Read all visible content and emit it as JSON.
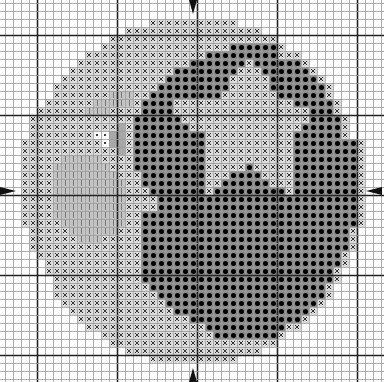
{
  "chart": {
    "type": "cross-stitch-pattern",
    "grid": {
      "columns": 47,
      "rows": 47,
      "cell_px": 8,
      "origin_x": 5,
      "origin_y": 3,
      "major_every": 10,
      "major_offset": 4
    },
    "colors": {
      "grid_minor": "#9a9a9a",
      "grid_major": "#222222",
      "cross_bg": "#d9d9d9",
      "dot_bg": "#8c8c8c",
      "vline_bg": "#c4c4c4",
      "pear_bg": "#a8a8a8",
      "white_bg": "#ffffff"
    },
    "legend_symbols": {
      "x": "light cross stitch",
      "o": "dark filled dot",
      "v": "vertical line stitch",
      "w": "white with small dot",
      "g": "medium gray"
    },
    "center_markers": [
      "top",
      "bottom",
      "left",
      "right"
    ],
    "rows": [
      [],
      [],
      [
        [
          "x",
          18,
          28
        ]
      ],
      [
        [
          "x",
          15,
          31
        ]
      ],
      [
        [
          "x",
          13,
          33
        ]
      ],
      [
        [
          "x",
          12,
          27
        ],
        [
          "o",
          28,
          33
        ],
        [
          "x",
          34,
          34
        ]
      ],
      [
        [
          "x",
          10,
          24
        ],
        [
          "o",
          25,
          33
        ],
        [
          "x",
          34,
          36
        ]
      ],
      [
        [
          "x",
          9,
          22
        ],
        [
          "o",
          23,
          29
        ],
        [
          "x",
          30,
          30
        ],
        [
          "o",
          31,
          36
        ],
        [
          "x",
          37,
          37
        ]
      ],
      [
        [
          "x",
          8,
          20
        ],
        [
          "o",
          21,
          28
        ],
        [
          "x",
          29,
          31
        ],
        [
          "o",
          32,
          37
        ],
        [
          "x",
          38,
          38
        ]
      ],
      [
        [
          "x",
          7,
          19
        ],
        [
          "o",
          20,
          27
        ],
        [
          "x",
          28,
          32
        ],
        [
          "o",
          33,
          38
        ],
        [
          "x",
          39,
          39
        ]
      ],
      [
        [
          "x",
          6,
          18
        ],
        [
          "o",
          19,
          27
        ],
        [
          "x",
          28,
          32
        ],
        [
          "o",
          33,
          39
        ],
        [
          "x",
          40,
          40
        ]
      ],
      [
        [
          "x",
          6,
          12
        ],
        [
          "v",
          13,
          15
        ],
        [
          "x",
          16,
          17
        ],
        [
          "o",
          18,
          26
        ],
        [
          "x",
          27,
          33
        ],
        [
          "o",
          34,
          39
        ],
        [
          "x",
          40,
          40
        ]
      ],
      [
        [
          "x",
          5,
          10
        ],
        [
          "v",
          11,
          15
        ],
        [
          "x",
          16,
          16
        ],
        [
          "o",
          17,
          20
        ],
        [
          "x",
          21,
          35
        ],
        [
          "o",
          36,
          40
        ],
        [
          "x",
          41,
          41
        ]
      ],
      [
        [
          "x",
          4,
          9
        ],
        [
          "v",
          10,
          12
        ],
        [
          "x",
          13,
          16
        ],
        [
          "o",
          17,
          20
        ],
        [
          "x",
          21,
          37
        ],
        [
          "o",
          38,
          40
        ],
        [
          "x",
          41,
          41
        ]
      ],
      [
        [
          "x",
          3,
          15
        ],
        [
          "o",
          16,
          21
        ],
        [
          "x",
          22,
          37
        ],
        [
          "o",
          38,
          41
        ],
        [
          "x",
          42,
          42
        ]
      ],
      [
        [
          "x",
          3,
          13
        ],
        [
          "g",
          14,
          14
        ],
        [
          "x",
          15,
          15
        ],
        [
          "o",
          16,
          22
        ],
        [
          "x",
          23,
          36
        ],
        [
          "o",
          37,
          41
        ],
        [
          "x",
          42,
          42
        ]
      ],
      [
        [
          "x",
          3,
          10
        ],
        [
          "w",
          11,
          12
        ],
        [
          "g",
          13,
          14
        ],
        [
          "x",
          15,
          15
        ],
        [
          "o",
          16,
          24
        ],
        [
          "x",
          25,
          35
        ],
        [
          "o",
          36,
          41
        ],
        [
          "x",
          42,
          42
        ]
      ],
      [
        [
          "x",
          2,
          11
        ],
        [
          "w",
          12,
          12
        ],
        [
          "g",
          13,
          14
        ],
        [
          "x",
          15,
          15
        ],
        [
          "o",
          16,
          24
        ],
        [
          "x",
          25,
          35
        ],
        [
          "o",
          36,
          43
        ],
        [
          "x",
          44,
          44
        ]
      ],
      [
        [
          "x",
          2,
          13
        ],
        [
          "g",
          14,
          14
        ],
        [
          "x",
          15,
          15
        ],
        [
          "o",
          16,
          24
        ],
        [
          "x",
          25,
          35
        ],
        [
          "o",
          36,
          43
        ],
        [
          "x",
          44,
          44
        ]
      ],
      [
        [
          "x",
          2,
          6
        ],
        [
          "v",
          7,
          11
        ],
        [
          "x",
          12,
          15
        ],
        [
          "o",
          16,
          24
        ],
        [
          "x",
          25,
          35
        ],
        [
          "o",
          36,
          43
        ],
        [
          "x",
          44,
          44
        ]
      ],
      [
        [
          "x",
          2,
          5
        ],
        [
          "v",
          6,
          12
        ],
        [
          "x",
          13,
          15
        ],
        [
          "o",
          16,
          24
        ],
        [
          "x",
          25,
          29
        ],
        [
          "o",
          30,
          30
        ],
        [
          "x",
          31,
          35
        ],
        [
          "o",
          36,
          43
        ],
        [
          "x",
          44,
          44
        ]
      ],
      [
        [
          "x",
          2,
          5
        ],
        [
          "v",
          6,
          13
        ],
        [
          "x",
          14,
          16
        ],
        [
          "o",
          17,
          24
        ],
        [
          "x",
          25,
          27
        ],
        [
          "o",
          28,
          31
        ],
        [
          "x",
          32,
          35
        ],
        [
          "o",
          36,
          43
        ],
        [
          "x",
          44,
          44
        ]
      ],
      [
        [
          "x",
          2,
          5
        ],
        [
          "v",
          6,
          14
        ],
        [
          "x",
          15,
          16
        ],
        [
          "o",
          17,
          24
        ],
        [
          "x",
          25,
          26
        ],
        [
          "o",
          27,
          32
        ],
        [
          "x",
          33,
          35
        ],
        [
          "o",
          36,
          43
        ],
        [
          "x",
          44,
          44
        ]
      ],
      [
        [
          "x",
          2,
          5
        ],
        [
          "v",
          6,
          14
        ],
        [
          "x",
          15,
          17
        ],
        [
          "o",
          18,
          24
        ],
        [
          "x",
          25,
          25
        ],
        [
          "o",
          26,
          34
        ],
        [
          "x",
          35,
          35
        ],
        [
          "o",
          36,
          43
        ],
        [
          "x",
          44,
          44
        ]
      ],
      [
        [
          "x",
          2,
          5
        ],
        [
          "v",
          6,
          14
        ],
        [
          "x",
          15,
          18
        ],
        [
          "o",
          19,
          43
        ],
        [
          "x",
          44,
          44
        ]
      ],
      [
        [
          "x",
          2,
          5
        ],
        [
          "v",
          6,
          14
        ],
        [
          "x",
          15,
          18
        ],
        [
          "o",
          19,
          43
        ],
        [
          "x",
          44,
          44
        ]
      ],
      [
        [
          "x",
          2,
          5
        ],
        [
          "v",
          6,
          14
        ],
        [
          "x",
          15,
          16
        ],
        [
          "o",
          17,
          43
        ],
        [
          "x",
          44,
          44
        ]
      ],
      [
        [
          "x",
          2,
          6
        ],
        [
          "v",
          7,
          14
        ],
        [
          "x",
          15,
          16
        ],
        [
          "o",
          17,
          43
        ],
        [
          "x",
          44,
          44
        ]
      ],
      [
        [
          "x",
          3,
          7
        ],
        [
          "v",
          8,
          13
        ],
        [
          "x",
          14,
          16
        ],
        [
          "o",
          17,
          42
        ],
        [
          "x",
          43,
          43
        ]
      ],
      [
        [
          "x",
          3,
          8
        ],
        [
          "v",
          9,
          11
        ],
        [
          "x",
          12,
          16
        ],
        [
          "o",
          17,
          42
        ],
        [
          "x",
          43,
          43
        ]
      ],
      [
        [
          "x",
          3,
          16
        ],
        [
          "o",
          17,
          42
        ],
        [
          "x",
          43,
          43
        ]
      ],
      [
        [
          "x",
          4,
          16
        ],
        [
          "o",
          17,
          41
        ],
        [
          "x",
          42,
          42
        ]
      ],
      [
        [
          "x",
          5,
          16
        ],
        [
          "o",
          17,
          41
        ],
        [
          "x",
          42,
          42
        ]
      ],
      [
        [
          "x",
          5,
          16
        ],
        [
          "o",
          17,
          40
        ],
        [
          "x",
          41,
          41
        ]
      ],
      [
        [
          "x",
          6,
          16
        ],
        [
          "o",
          17,
          40
        ],
        [
          "x",
          41,
          41
        ]
      ],
      [
        [
          "x",
          6,
          17
        ],
        [
          "o",
          18,
          39
        ],
        [
          "x",
          40,
          40
        ]
      ],
      [
        [
          "x",
          6,
          18
        ],
        [
          "o",
          19,
          39
        ],
        [
          "x",
          40,
          40
        ]
      ],
      [
        [
          "x",
          7,
          19
        ],
        [
          "o",
          20,
          38
        ],
        [
          "x",
          39,
          39
        ]
      ],
      [
        [
          "x",
          8,
          20
        ],
        [
          "o",
          21,
          37
        ],
        [
          "x",
          38,
          38
        ]
      ],
      [
        [
          "x",
          9,
          22
        ],
        [
          "o",
          23,
          36
        ],
        [
          "x",
          37,
          37
        ]
      ],
      [
        [
          "x",
          10,
          24
        ],
        [
          "o",
          25,
          34
        ],
        [
          "x",
          35,
          36
        ]
      ],
      [
        [
          "x",
          12,
          25
        ],
        [
          "o",
          26,
          33
        ],
        [
          "x",
          34,
          34
        ]
      ],
      [
        [
          "x",
          13,
          33
        ]
      ],
      [
        [
          "x",
          15,
          31
        ]
      ],
      [
        [
          "x",
          18,
          28
        ]
      ],
      [],
      []
    ]
  }
}
